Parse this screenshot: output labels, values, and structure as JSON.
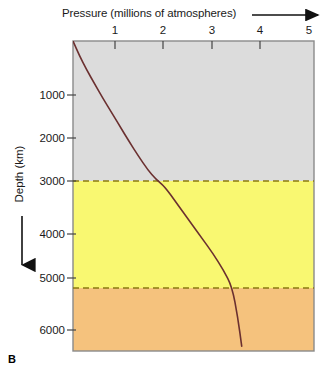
{
  "figure": {
    "panel_letter": "B"
  },
  "axes": {
    "x": {
      "title": "Pressure (millions of atmospheres)",
      "ticks": [
        "1",
        "2",
        "3",
        "4",
        "5"
      ],
      "arrow": "right-arrow-icon"
    },
    "y": {
      "title": "Depth (km)",
      "ticks": [
        "1000",
        "2000",
        "3000",
        "4000",
        "5000",
        "6000"
      ],
      "arrow": "down-arrow-icon"
    }
  },
  "layers": [
    {
      "label": "Mantle",
      "color": "#dcdcdc"
    },
    {
      "label": "Outer core",
      "color": "#f9f871"
    },
    {
      "label": "Outer core",
      "color": "#f9f871"
    },
    {
      "label": "Inner core",
      "color": "#f5c27d"
    }
  ],
  "colors": {
    "mantle": "#dcdcdc",
    "outer_core": "#f9f871",
    "inner_core": "#f5c27d",
    "curve": "#6b3030",
    "boundary_dash": "#8a7a10",
    "frame": "#8a8a8a"
  },
  "chart_data": {
    "type": "line",
    "title": "Pressure (millions of atmospheres)",
    "xlabel": "Pressure (millions of atmospheres)",
    "ylabel": "Depth (km)",
    "xlim": [
      0,
      5
    ],
    "ylim": [
      0,
      6500
    ],
    "y_inverted": true,
    "grid": false,
    "legend": "none",
    "xticks": [
      1,
      2,
      3,
      4,
      5
    ],
    "yticks": [
      1000,
      2000,
      3000,
      4000,
      5000,
      6000
    ],
    "series": [
      {
        "name": "Pressure vs depth",
        "x": [
          0.0,
          0.13,
          0.28,
          0.45,
          0.62,
          0.8,
          0.98,
          1.16,
          1.35,
          1.55,
          1.72,
          1.9,
          2.15,
          2.4,
          2.65,
          2.9,
          3.12,
          3.3,
          3.42,
          3.5
        ],
        "y": [
          0,
          300,
          600,
          900,
          1200,
          1500,
          1800,
          2100,
          2400,
          2700,
          2900,
          3050,
          3400,
          3750,
          4100,
          4450,
          4800,
          5150,
          5800,
          6400
        ]
      }
    ],
    "annotations": [
      {
        "text": "Mantle",
        "depth_km": 2750,
        "region": [
          0,
          2900
        ]
      },
      {
        "text": "Outer core",
        "depth_km": 3050,
        "region": [
          2900,
          5150
        ]
      },
      {
        "text": "Outer core",
        "depth_km": 4980,
        "region": [
          2900,
          5150
        ]
      },
      {
        "text": "Inner core",
        "depth_km": 5380,
        "region": [
          5150,
          6400
        ]
      }
    ],
    "boundaries": [
      {
        "name": "mantle-outer-core",
        "depth_km": 2900
      },
      {
        "name": "outer-inner-core",
        "depth_km": 5150
      }
    ]
  }
}
